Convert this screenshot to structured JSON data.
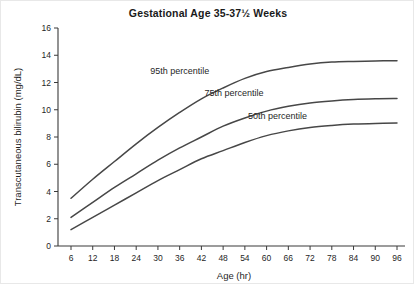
{
  "chart_data": {
    "type": "line",
    "title": "Gestational Age 35-37½ Weeks",
    "xlabel": "Age (hr)",
    "ylabel": "Transcutaneous bilirubin (mg/dL)",
    "xlim": [
      0,
      99
    ],
    "ylim": [
      0,
      16
    ],
    "xticks": [
      6,
      12,
      18,
      24,
      30,
      36,
      42,
      48,
      54,
      60,
      66,
      72,
      78,
      84,
      90,
      96
    ],
    "yticks": [
      0,
      2,
      4,
      6,
      8,
      10,
      12,
      14,
      16
    ],
    "grid": false,
    "legend_position": "inline-annotations",
    "x": [
      6,
      12,
      18,
      24,
      30,
      36,
      42,
      48,
      54,
      60,
      66,
      72,
      78,
      84,
      90,
      96
    ],
    "series": [
      {
        "name": "95th percentile",
        "label": "95th percentile",
        "label_x": 36,
        "label_y": 12.6,
        "values": [
          3.5,
          4.9,
          6.2,
          7.5,
          8.7,
          9.8,
          10.8,
          11.6,
          12.3,
          12.8,
          13.1,
          13.35,
          13.5,
          13.55,
          13.58,
          13.6
        ]
      },
      {
        "name": "75th percentile",
        "label": "75th percentile",
        "label_x": 51,
        "label_y": 11.0,
        "values": [
          2.1,
          3.2,
          4.3,
          5.3,
          6.3,
          7.2,
          8.0,
          8.8,
          9.4,
          9.9,
          10.25,
          10.5,
          10.65,
          10.75,
          10.8,
          10.82
        ]
      },
      {
        "name": "50th percentile",
        "label": "50th percentile",
        "label_x": 63,
        "label_y": 9.3,
        "values": [
          1.2,
          2.1,
          3.0,
          3.9,
          4.8,
          5.6,
          6.4,
          7.0,
          7.6,
          8.1,
          8.45,
          8.7,
          8.85,
          8.95,
          9.0,
          9.02
        ]
      }
    ]
  },
  "colors": {
    "curve": "#474747",
    "axis": "#3a3a3a",
    "text": "#1f1f1f",
    "background": "#ffffff"
  }
}
